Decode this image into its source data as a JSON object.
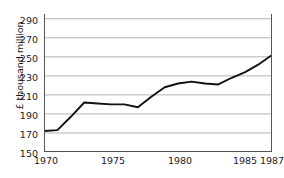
{
  "chart_data": {
    "type": "line",
    "title": "",
    "xlabel": "",
    "ylabel": "£ thousand million",
    "xlim": [
      1970,
      1987
    ],
    "ylim": [
      150,
      295
    ],
    "grid": true,
    "legend": "none",
    "y_ticks": [
      290,
      270,
      250,
      230,
      210,
      190,
      170,
      150
    ],
    "x_ticks": [
      1970,
      1975,
      1980,
      1985,
      1987
    ],
    "x_tick_labels": [
      "1970",
      "1975",
      "1980",
      "1985",
      "1987"
    ],
    "series": [
      {
        "name": "£ thousand million",
        "color": "#111111",
        "x": [
          1970,
          1971,
          1972,
          1973,
          1974,
          1975,
          1976,
          1977,
          1978,
          1979,
          1980,
          1981,
          1982,
          1983,
          1984,
          1985,
          1986,
          1987
        ],
        "values": [
          172,
          173,
          187,
          202,
          201,
          200,
          200,
          197,
          208,
          218,
          222,
          224,
          222,
          221,
          228,
          234,
          242,
          252
        ]
      }
    ]
  },
  "axis": {
    "y_title": "£ thousand million",
    "y_tick_0": "290",
    "y_tick_1": "270",
    "y_tick_2": "250",
    "y_tick_3": "230",
    "y_tick_4": "210",
    "y_tick_5": "190",
    "y_tick_6": "170",
    "y_tick_7": "150",
    "x_tick_0": "1970",
    "x_tick_1": "1975",
    "x_tick_2": "1980",
    "x_tick_3": "1985",
    "x_tick_4": "1987"
  },
  "colors": {
    "line": "#111111",
    "grid": "#b4b4b4",
    "axis": "#555555",
    "background": "#ffffff",
    "text": "#1a1a1a"
  }
}
